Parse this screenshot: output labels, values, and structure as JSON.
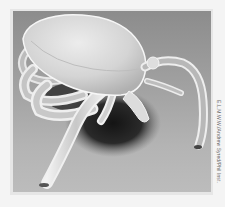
{
  "image": {
    "subject": "Scanning electron micrograph of a tick",
    "style": "grayscale",
    "colors": {
      "page_background": "#f4f4f4",
      "frame": "#e6e6e6",
      "photo_background_top": "#8c8c8c",
      "photo_background_bottom": "#bcbcbc",
      "body_highlight": "#e8e8e8",
      "shadow": "#1e1e1e"
    }
  },
  "credit": {
    "text": "E.L.M.W.W./Andrew Syred/Phil Inst."
  }
}
